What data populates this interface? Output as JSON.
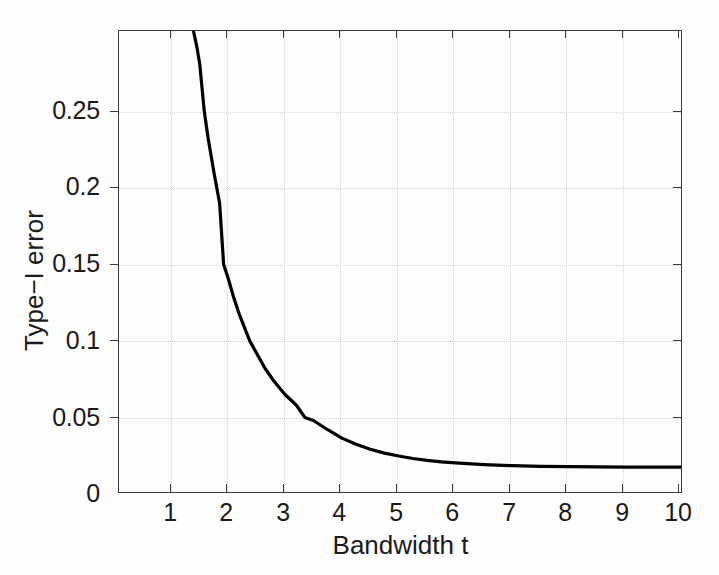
{
  "chart_data": {
    "type": "line",
    "title": "",
    "xlabel": "Bandwidth t",
    "ylabel": "Type−I error",
    "xlim": [
      0.08,
      10.0
    ],
    "ylim": [
      0.0,
      0.3025
    ],
    "xticks": [
      1,
      2,
      3,
      4,
      5,
      6,
      7,
      8,
      9,
      10
    ],
    "xticklabels": [
      "1",
      "2",
      "3",
      "4",
      "5",
      "6",
      "7",
      "8",
      "9",
      "10"
    ],
    "yticks": [
      0,
      0.05,
      0.1,
      0.15,
      0.2,
      0.25
    ],
    "yticklabels": [
      "0",
      "0.05",
      "0.1",
      "0.15",
      "0.2",
      "0.25"
    ],
    "grid": true,
    "grid_style": "dotted",
    "legend": null,
    "line_color": "#000000",
    "line_width": 3,
    "series": [
      {
        "name": "Type-I error vs bandwidth",
        "x": [
          1.39,
          1.45,
          1.5,
          1.58,
          1.65,
          1.75,
          1.85,
          1.92,
          2.0,
          2.1,
          2.2,
          2.38,
          2.5,
          2.65,
          2.8,
          3.0,
          3.2,
          3.35,
          3.5,
          3.75,
          4.0,
          4.25,
          4.5,
          4.75,
          5.0,
          5.25,
          5.5,
          5.75,
          6.0,
          6.5,
          7.0,
          7.5,
          8.0,
          8.5,
          9.0,
          9.5,
          10.0
        ],
        "y": [
          0.3025,
          0.292,
          0.281,
          0.25,
          0.232,
          0.21,
          0.19,
          0.15,
          0.141,
          0.128,
          0.117,
          0.1,
          0.092,
          0.082,
          0.074,
          0.065,
          0.058,
          0.05,
          0.048,
          0.042,
          0.0365,
          0.0325,
          0.0292,
          0.0267,
          0.0248,
          0.0232,
          0.022,
          0.021,
          0.0203,
          0.0192,
          0.0185,
          0.0181,
          0.0179,
          0.0177,
          0.0176,
          0.0176,
          0.0176
        ]
      }
    ],
    "asymptote": 0.0176
  },
  "axes": {
    "y_tick_labels": [
      "0.25",
      "0.2",
      "0.15",
      "0.1",
      "0.05",
      "0"
    ],
    "x_tick_labels": [
      "1",
      "2",
      "3",
      "4",
      "5",
      "6",
      "7",
      "8",
      "9",
      "10"
    ],
    "y_axis_title": "Type−I error",
    "x_axis_title": "Bandwidth t"
  },
  "colors": {
    "curve": "#000000",
    "axis": "#3a3a3a",
    "grid": "#d2d2d2",
    "background": "#fdfdfd",
    "text": "#1a1a1a"
  }
}
